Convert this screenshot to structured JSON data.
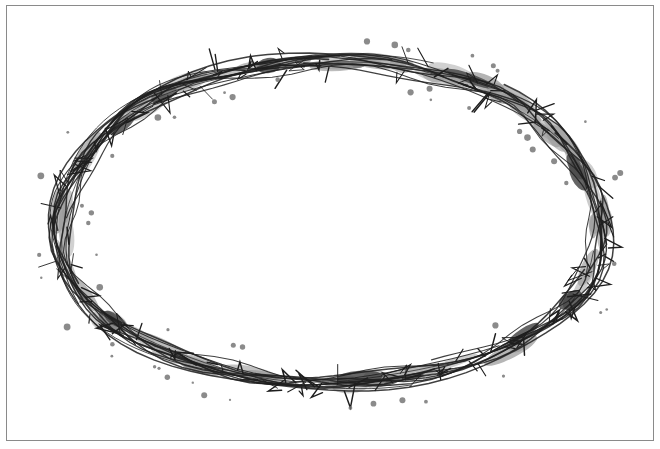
{
  "image": {
    "subject": "Crown of thorns illustration",
    "style": "ink and gray watercolor wash",
    "shape": "horizontal oval wreath",
    "colors": {
      "background": "#ffffff",
      "frame_border": "#8a8a8a",
      "ink": "#1e1e1e",
      "wash_light": "#9a9a9a",
      "wash_dark": "#4a4a4a",
      "splatter": "#6e6e6e"
    },
    "wreath": {
      "cx": 330,
      "cy": 222,
      "rx": 270,
      "ry": 165
    }
  }
}
